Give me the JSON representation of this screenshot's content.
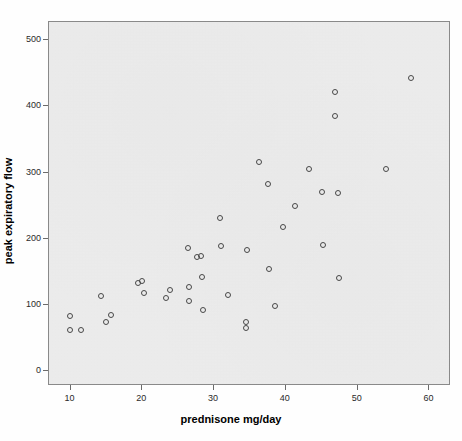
{
  "chart_data": {
    "type": "scatter",
    "title": "",
    "xlabel": "prednisone mg/day",
    "ylabel": "peak expiratory flow",
    "xlim": [
      7,
      63
    ],
    "ylim": [
      -22,
      527
    ],
    "xticks": [
      10,
      20,
      30,
      40,
      50,
      60
    ],
    "yticks": [
      0,
      100,
      200,
      300,
      400,
      500
    ],
    "grid": false,
    "legend": false,
    "marker": "open-circle",
    "marker_color": "#4a4a4a",
    "plot_background": "#eeeeee",
    "points": [
      {
        "x": 9.9,
        "y": 83
      },
      {
        "x": 9.9,
        "y": 62
      },
      {
        "x": 11.4,
        "y": 63
      },
      {
        "x": 14.3,
        "y": 113
      },
      {
        "x": 15.0,
        "y": 74
      },
      {
        "x": 15.7,
        "y": 85
      },
      {
        "x": 19.4,
        "y": 134
      },
      {
        "x": 19.9,
        "y": 136
      },
      {
        "x": 20.3,
        "y": 119
      },
      {
        "x": 23.3,
        "y": 110
      },
      {
        "x": 23.9,
        "y": 123
      },
      {
        "x": 26.4,
        "y": 186
      },
      {
        "x": 26.5,
        "y": 128
      },
      {
        "x": 26.5,
        "y": 106
      },
      {
        "x": 27.6,
        "y": 173
      },
      {
        "x": 28.2,
        "y": 174
      },
      {
        "x": 28.3,
        "y": 143
      },
      {
        "x": 28.4,
        "y": 92
      },
      {
        "x": 30.8,
        "y": 231
      },
      {
        "x": 30.9,
        "y": 189
      },
      {
        "x": 32.0,
        "y": 116
      },
      {
        "x": 34.4,
        "y": 74
      },
      {
        "x": 34.4,
        "y": 65
      },
      {
        "x": 34.6,
        "y": 183
      },
      {
        "x": 36.3,
        "y": 316
      },
      {
        "x": 37.5,
        "y": 282
      },
      {
        "x": 37.6,
        "y": 154
      },
      {
        "x": 38.5,
        "y": 98
      },
      {
        "x": 39.6,
        "y": 218
      },
      {
        "x": 41.3,
        "y": 249
      },
      {
        "x": 43.2,
        "y": 306
      },
      {
        "x": 45.0,
        "y": 271
      },
      {
        "x": 45.1,
        "y": 190
      },
      {
        "x": 46.9,
        "y": 422
      },
      {
        "x": 46.9,
        "y": 385
      },
      {
        "x": 47.3,
        "y": 269
      },
      {
        "x": 47.4,
        "y": 141
      },
      {
        "x": 54.0,
        "y": 305
      },
      {
        "x": 57.4,
        "y": 443
      }
    ]
  }
}
